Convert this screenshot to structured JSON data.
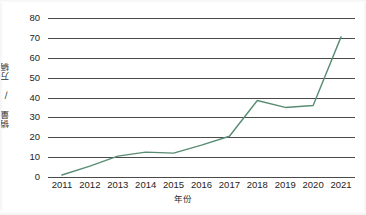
{
  "chart_data": {
    "type": "line",
    "title": "",
    "subtitle": "",
    "xlabel": "年份",
    "ylabel": "销量 / 万辆",
    "categories": [
      "2011",
      "2012",
      "2013",
      "2014",
      "2015",
      "2016",
      "2017",
      "2018",
      "2019",
      "2020",
      "2021"
    ],
    "x": [
      2011,
      2012,
      2013,
      2014,
      2015,
      2016,
      2017,
      2018,
      2019,
      2020,
      2021
    ],
    "series": [
      {
        "name": "销量",
        "color": "#5a8c74",
        "values": [
          1,
          5.5,
          10.5,
          12.5,
          12,
          16,
          20.5,
          38.5,
          35,
          36,
          70.5
        ]
      }
    ],
    "ylim": [
      0,
      80
    ],
    "ytick_labels": [
      "80",
      "70",
      "60",
      "50",
      "40",
      "30",
      "20",
      "10",
      "0"
    ],
    "ytick_values": [
      80,
      70,
      60,
      50,
      40,
      30,
      20,
      10,
      0
    ],
    "ystep": 10,
    "grid": "horizontal",
    "grid_color": "#4a4a4a",
    "legend": "none",
    "markers": false,
    "annotations": []
  },
  "axes": {
    "y_title": "销量 / 万辆",
    "x_title": "年份"
  }
}
